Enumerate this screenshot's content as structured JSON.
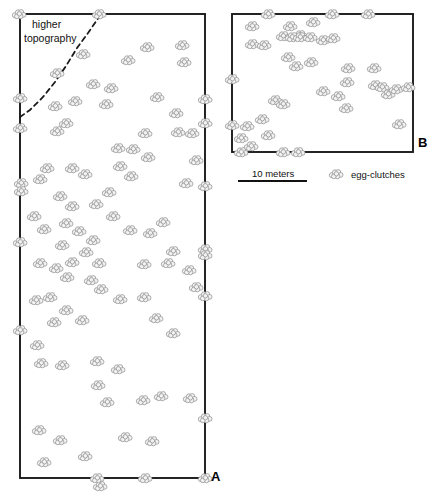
{
  "figure": {
    "background_color": "#ffffff",
    "outline_color": "#1a1a1a",
    "clutch_fill": "#f2f2f2",
    "clutch_stroke": "#8c8c8c"
  },
  "panels": [
    {
      "id": "A",
      "label": "A",
      "name": "plot-panel-a",
      "shape": "rectangle",
      "x": 20,
      "y": 14,
      "width": 185,
      "height": 464,
      "annotation": {
        "text_line1": "higher",
        "text_line2": "topography",
        "boundary_style": "dashed"
      }
    },
    {
      "id": "B",
      "label": "B",
      "name": "plot-panel-b",
      "shape": "rectangle",
      "x": 232,
      "y": 14,
      "width": 181,
      "height": 138
    }
  ],
  "scale_bar": {
    "label": "10 meters",
    "x1": 238,
    "x2": 307,
    "y": 181
  },
  "legend": {
    "symbol_name": "egg-clutch-symbol",
    "label": "egg-clutches",
    "symbol_x": 336,
    "symbol_y": 174
  },
  "chart_data": {
    "type": "scatter",
    "title": "",
    "xlabel": "",
    "ylabel": "",
    "units": "meters",
    "scale_bar_meters": 10,
    "scale_bar_pixels": 69,
    "legend_entries": [
      "egg-clutches"
    ],
    "grid": false,
    "series": [
      {
        "name": "egg-clutches-panel-A",
        "panel": "A",
        "count": 96,
        "points": [
          [
            99,
            14
          ],
          [
            19,
            14
          ],
          [
            20,
            98
          ],
          [
            20,
            128
          ],
          [
            21,
            183
          ],
          [
            21,
            191
          ],
          [
            20,
            242
          ],
          [
            20,
            330
          ],
          [
            205,
            99
          ],
          [
            205,
            123
          ],
          [
            205,
            186
          ],
          [
            205,
            249
          ],
          [
            205,
            255
          ],
          [
            205,
            296
          ],
          [
            205,
            418
          ],
          [
            100,
            486
          ],
          [
            97,
            478
          ],
          [
            145,
            478
          ],
          [
            205,
            478
          ],
          [
            55,
            106
          ],
          [
            75,
            101
          ],
          [
            106,
            104
          ],
          [
            66,
            123
          ],
          [
            57,
            131
          ],
          [
            93,
            84
          ],
          [
            111,
            88
          ],
          [
            47,
            168
          ],
          [
            40,
            179
          ],
          [
            60,
            196
          ],
          [
            72,
            206
          ],
          [
            96,
            204
          ],
          [
            109,
            192
          ],
          [
            113,
            216
          ],
          [
            128,
            60
          ],
          [
            147,
            47
          ],
          [
            182,
            45
          ],
          [
            184,
            62
          ],
          [
            157,
            97
          ],
          [
            176,
            113
          ],
          [
            178,
            132
          ],
          [
            148,
            157
          ],
          [
            192,
            133
          ],
          [
            196,
            160
          ],
          [
            186,
            183
          ],
          [
            34,
            216
          ],
          [
            44,
            229
          ],
          [
            66,
            223
          ],
          [
            79,
            231
          ],
          [
            62,
            245
          ],
          [
            86,
            252
          ],
          [
            93,
            240
          ],
          [
            40,
            263
          ],
          [
            56,
            268
          ],
          [
            72,
            262
          ],
          [
            99,
            263
          ],
          [
            67,
            277
          ],
          [
            91,
            280
          ],
          [
            101,
            289
          ],
          [
            144,
            264
          ],
          [
            168,
            263
          ],
          [
            173,
            251
          ],
          [
            189,
            270
          ],
          [
            196,
            287
          ],
          [
            36,
            300
          ],
          [
            50,
            297
          ],
          [
            66,
            310
          ],
          [
            54,
            322
          ],
          [
            82,
            320
          ],
          [
            120,
            299
          ],
          [
            144,
            297
          ],
          [
            37,
            345
          ],
          [
            41,
            363
          ],
          [
            62,
            365
          ],
          [
            97,
            361
          ],
          [
            118,
            369
          ],
          [
            98,
            385
          ],
          [
            107,
            402
          ],
          [
            143,
            400
          ],
          [
            161,
            396
          ],
          [
            190,
            398
          ],
          [
            39,
            430
          ],
          [
            44,
            462
          ],
          [
            85,
            456
          ],
          [
            125,
            437
          ],
          [
            156,
            318
          ],
          [
            173,
            333
          ],
          [
            60,
            440
          ],
          [
            152,
            441
          ],
          [
            118,
            148
          ],
          [
            133,
            149
          ],
          [
            145,
            133
          ],
          [
            83,
            54
          ],
          [
            57,
            73
          ],
          [
            72,
            168
          ],
          [
            85,
            174
          ],
          [
            130,
            230
          ],
          [
            150,
            233
          ],
          [
            163,
            222
          ],
          [
            120,
            166
          ],
          [
            131,
            176
          ]
        ]
      },
      {
        "name": "egg-clutches-panel-B",
        "panel": "B",
        "count": 42,
        "points": [
          [
            268,
            14
          ],
          [
            332,
            14
          ],
          [
            368,
            14
          ],
          [
            232,
            79
          ],
          [
            232,
            125
          ],
          [
            241,
            152
          ],
          [
            283,
            152
          ],
          [
            298,
            152
          ],
          [
            252,
            26
          ],
          [
            252,
            44
          ],
          [
            264,
            45
          ],
          [
            290,
            26
          ],
          [
            300,
            35
          ],
          [
            313,
            22
          ],
          [
            283,
            36
          ],
          [
            292,
            37
          ],
          [
            300,
            37
          ],
          [
            310,
            37
          ],
          [
            323,
            40
          ],
          [
            333,
            38
          ],
          [
            288,
            57
          ],
          [
            296,
            66
          ],
          [
            311,
            62
          ],
          [
            323,
            91
          ],
          [
            347,
            82
          ],
          [
            348,
            68
          ],
          [
            338,
            96
          ],
          [
            346,
            108
          ],
          [
            374,
            68
          ],
          [
            375,
            85
          ],
          [
            382,
            87
          ],
          [
            388,
            94
          ],
          [
            396,
            89
          ],
          [
            408,
            87
          ],
          [
            399,
            124
          ],
          [
            241,
            138
          ],
          [
            247,
            126
          ],
          [
            251,
            146
          ],
          [
            262,
            119
          ],
          [
            268,
            135
          ],
          [
            275,
            100
          ],
          [
            283,
            104
          ]
        ]
      }
    ],
    "topography_boundary": {
      "panel": "A",
      "style": "dashed",
      "label": "higher topography",
      "path": [
        [
          20,
          117
        ],
        [
          30,
          110
        ],
        [
          43,
          97
        ],
        [
          55,
          82
        ],
        [
          66,
          66
        ],
        [
          77,
          48
        ],
        [
          88,
          33
        ],
        [
          97,
          20
        ],
        [
          101,
          14
        ]
      ]
    }
  }
}
